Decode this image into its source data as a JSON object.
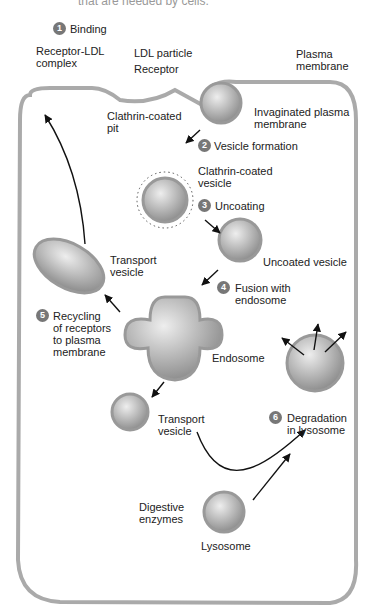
{
  "header": {
    "cut_text": "that are needed by cells."
  },
  "steps": [
    {
      "n": "1",
      "label": "Binding"
    },
    {
      "n": "2",
      "label": "Vesicle formation"
    },
    {
      "n": "3",
      "label": "Uncoating"
    },
    {
      "n": "4",
      "label": "Fusion with\nendosome"
    },
    {
      "n": "5",
      "label": "Recycling\nof receptors\nto plasma\nmembrane"
    },
    {
      "n": "6",
      "label": "Degradation\nin lysosome"
    }
  ],
  "labels": {
    "receptor_ldl_complex": "Receptor-LDL\ncomplex",
    "ldl_particle": "LDL particle",
    "receptor": "Receptor",
    "plasma_membrane": "Plasma\nmembrane",
    "clathrin_pit": "Clathrin-coated\npit",
    "invaginated": "Invaginated plasma\nmembrane",
    "clathrin_vesicle": "Clathrin-coated\nvesicle",
    "uncoated_vesicle": "Uncoated vesicle",
    "transport_vesicle_top": "Transport\nvesicle",
    "endosome": "Endosome",
    "transport_vesicle_bottom": "Transport\nvesicle",
    "digestive_enzymes": "Digestive\nenzymes",
    "lysosome": "Lysosome"
  }
}
